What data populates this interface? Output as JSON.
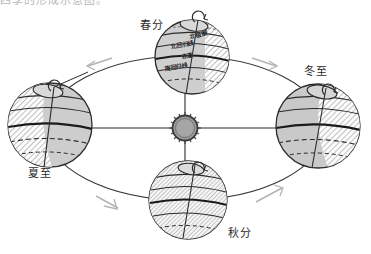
{
  "figure": {
    "title_clipped": "四季的形成示意图。",
    "background_color": "#ffffff",
    "ink_color": "#2b2b2b",
    "shade_color": "#9a9a9a",
    "orbit_arrow_color": "#b0b0b0"
  },
  "sun": {
    "name": "sun",
    "fill_color": "#8f8f8f",
    "corona_color": "#4a4a4a"
  },
  "seasons": [
    {
      "key": "spring_equinox",
      "label": "春分",
      "position": "top",
      "label_x": 140,
      "label_y": 22,
      "globe_cx": 192,
      "globe_cy": 57,
      "globe_r": 37,
      "shade": "right-sliver"
    },
    {
      "key": "winter_solstice",
      "label": "冬至",
      "position": "right",
      "label_x": 304,
      "label_y": 68,
      "globe_cx": 318,
      "globe_cy": 126,
      "globe_r": 42,
      "shade": "right-half"
    },
    {
      "key": "autumn_equinox",
      "label": "秋分",
      "position": "bottom",
      "label_x": 228,
      "label_y": 229,
      "globe_cx": 188,
      "globe_cy": 200,
      "globe_r": 39,
      "shade": "full"
    },
    {
      "key": "summer_solstice",
      "label": "夏至",
      "position": "left",
      "label_x": 28,
      "label_y": 170,
      "globe_cx": 50,
      "globe_cy": 125,
      "globe_r": 42,
      "shade": "left-half"
    }
  ],
  "latitude_labels": [
    {
      "key": "arctic_circle",
      "label": "北极圈",
      "x": 189,
      "y": 34
    },
    {
      "key": "tropic_of_cancer",
      "label": "北回归线",
      "x": 172,
      "y": 44
    },
    {
      "key": "equator",
      "label": "赤道",
      "x": 181,
      "y": 55
    },
    {
      "key": "tropic_of_capricorn",
      "label": "南回归线",
      "x": 166,
      "y": 66
    }
  ],
  "rotation_markers": [
    {
      "key": "rotation-spring",
      "cx": 200,
      "cy": 20
    },
    {
      "key": "rotation-winter",
      "cx": 330,
      "cy": 93
    },
    {
      "key": "rotation-autumn",
      "cx": 200,
      "cy": 171
    },
    {
      "key": "rotation-summer",
      "cx": 56,
      "cy": 89
    }
  ],
  "orbit": {
    "cx": 185,
    "cy": 128,
    "rx": 140,
    "ry": 72,
    "direction": "counterclockwise"
  },
  "orbit_arrows": [
    {
      "key": "orbit-arrow-upper-left",
      "x": 88,
      "y": 63,
      "rot": -28
    },
    {
      "key": "orbit-arrow-upper-right",
      "x": 258,
      "y": 55,
      "rot": 205
    },
    {
      "key": "orbit-arrow-lower-left",
      "x": 100,
      "y": 202,
      "rot": 150
    },
    {
      "key": "orbit-arrow-lower-right",
      "x": 272,
      "y": 196,
      "rot": 27
    }
  ],
  "sun_rays": [
    {
      "key": "ray-left",
      "x2": 62,
      "y2": 128
    },
    {
      "key": "ray-right",
      "x2": 300,
      "y2": 128
    },
    {
      "key": "ray-up",
      "x2": 185,
      "y2": 70
    },
    {
      "key": "ray-down",
      "x2": 185,
      "y2": 178
    }
  ]
}
